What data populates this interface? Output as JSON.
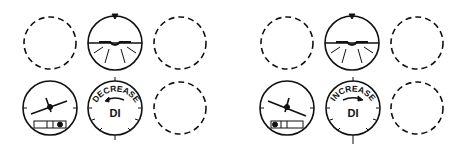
{
  "panels": [
    {
      "id": "left",
      "attitude_indicator": {
        "bank": "level"
      },
      "turn_coordinator": {
        "bank_direction": "left",
        "ball": "right"
      },
      "heading_indicator": {
        "label": "DI",
        "arc_label": "DECREASE",
        "arrow_direction": "left"
      }
    },
    {
      "id": "right",
      "attitude_indicator": {
        "bank": "level"
      },
      "turn_coordinator": {
        "bank_direction": "right",
        "ball": "left"
      },
      "heading_indicator": {
        "label": "DI",
        "arc_label": "INCREASE",
        "arrow_direction": "right"
      }
    }
  ],
  "colors": {
    "ink": "#111111",
    "background": "#ffffff"
  }
}
